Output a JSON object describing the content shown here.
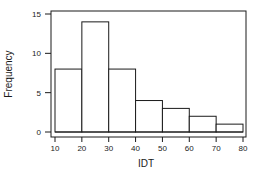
{
  "chart_data": {
    "type": "bar",
    "title": "",
    "xlabel": "IDT",
    "ylabel": "Frequency",
    "bins": [
      [
        10,
        20
      ],
      [
        20,
        30
      ],
      [
        30,
        40
      ],
      [
        40,
        50
      ],
      [
        50,
        60
      ],
      [
        60,
        70
      ],
      [
        70,
        80
      ]
    ],
    "categories": [
      "10-20",
      "20-30",
      "30-40",
      "40-50",
      "50-60",
      "60-70",
      "70-80"
    ],
    "values": [
      8,
      14,
      8,
      4,
      3,
      2,
      1
    ],
    "xlim": [
      10,
      80
    ],
    "ylim": [
      0,
      15
    ],
    "xticks": [
      10,
      20,
      30,
      40,
      50,
      60,
      70,
      80
    ],
    "yticks": [
      0,
      5,
      10,
      15
    ],
    "grid": false,
    "legend": null,
    "histogram": true
  },
  "labels": {
    "xlabel": "IDT",
    "ylabel": "Frequency",
    "xticks": [
      "10",
      "20",
      "30",
      "40",
      "50",
      "60",
      "70",
      "80"
    ],
    "yticks": [
      "0",
      "5",
      "10",
      "15"
    ]
  },
  "colors": {
    "stroke": "#1a1a1a",
    "bar_fill": "#ffffff",
    "background": "#ffffff"
  }
}
